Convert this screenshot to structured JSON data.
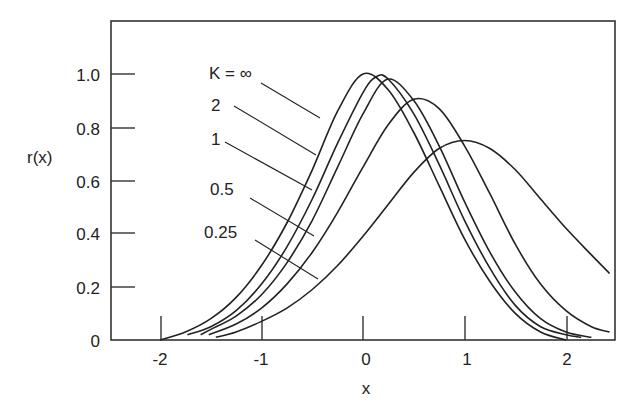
{
  "chart_data": {
    "type": "line",
    "title": "",
    "xlabel": "x",
    "ylabel": "r(x)",
    "xlim": [
      -2.5,
      2.45
    ],
    "ylim": [
      0,
      1.2
    ],
    "grid": false,
    "legend": "inline labels with leader lines",
    "x_ticks": [
      -2,
      -1,
      0,
      1,
      2
    ],
    "x_tick_labels": [
      "-2",
      "-1",
      "0",
      "1",
      "2"
    ],
    "y_ticks": [
      0,
      0.2,
      0.4,
      0.6,
      0.8,
      1.0
    ],
    "y_tick_labels": [
      "0",
      "0.2",
      "0.4",
      "0.6",
      "0.8",
      "1.0"
    ],
    "series": [
      {
        "name": "K=∞",
        "label": "K = ∞",
        "x": [
          -2.0,
          -1.75,
          -1.5,
          -1.25,
          -1.0,
          -0.75,
          -0.5,
          -0.25,
          0.0,
          0.25,
          0.5,
          0.75,
          1.0,
          1.25,
          1.5,
          1.75,
          2.0
        ],
        "y": [
          0.0,
          0.03,
          0.08,
          0.16,
          0.28,
          0.44,
          0.64,
          0.86,
          1.0,
          0.94,
          0.78,
          0.58,
          0.38,
          0.22,
          0.1,
          0.03,
          0.0
        ]
      },
      {
        "name": "K=2",
        "label": "2",
        "x": [
          -1.73,
          -1.5,
          -1.25,
          -1.0,
          -0.75,
          -0.5,
          -0.25,
          0.0,
          0.13,
          0.25,
          0.5,
          0.75,
          1.0,
          1.25,
          1.5,
          1.75,
          2.0,
          2.15
        ],
        "y": [
          0.02,
          0.05,
          0.11,
          0.21,
          0.35,
          0.53,
          0.74,
          0.93,
          0.99,
          0.98,
          0.85,
          0.66,
          0.45,
          0.27,
          0.13,
          0.05,
          0.02,
          0.01
        ]
      },
      {
        "name": "K=1",
        "label": "1",
        "x": [
          -1.6,
          -1.5,
          -1.25,
          -1.0,
          -0.75,
          -0.5,
          -0.25,
          0.0,
          0.24,
          0.5,
          0.75,
          1.0,
          1.25,
          1.5,
          1.75,
          2.0,
          2.25
        ],
        "y": [
          0.02,
          0.04,
          0.09,
          0.17,
          0.29,
          0.45,
          0.65,
          0.85,
          0.98,
          0.9,
          0.73,
          0.52,
          0.33,
          0.18,
          0.08,
          0.03,
          0.01
        ]
      },
      {
        "name": "K=0.5",
        "label": "0.5",
        "x": [
          -1.52,
          -1.25,
          -1.0,
          -0.75,
          -0.5,
          -0.25,
          0.0,
          0.25,
          0.5,
          0.75,
          1.0,
          1.25,
          1.5,
          1.75,
          2.0,
          2.25,
          2.43
        ],
        "y": [
          0.02,
          0.06,
          0.12,
          0.21,
          0.33,
          0.48,
          0.65,
          0.81,
          0.905,
          0.87,
          0.73,
          0.55,
          0.36,
          0.21,
          0.11,
          0.05,
          0.03
        ]
      },
      {
        "name": "K=0.25",
        "label": "0.25",
        "x": [
          -1.45,
          -1.25,
          -1.0,
          -0.75,
          -0.5,
          -0.25,
          0.0,
          0.25,
          0.5,
          0.75,
          1.0,
          1.25,
          1.5,
          1.75,
          2.0,
          2.25,
          2.43
        ],
        "y": [
          0.01,
          0.03,
          0.07,
          0.12,
          0.19,
          0.28,
          0.39,
          0.51,
          0.63,
          0.72,
          0.75,
          0.72,
          0.64,
          0.53,
          0.42,
          0.32,
          0.25
        ]
      }
    ],
    "annotations": [
      {
        "text": "K = ∞",
        "label_x": -1.49,
        "label_y": 0.99,
        "leader_to_x": -0.42,
        "leader_to_y": 0.83
      },
      {
        "text": "2",
        "label_x": -1.49,
        "label_y": 0.86,
        "leader_to_x": -0.47,
        "leader_to_y": 0.69
      },
      {
        "text": "1",
        "label_x": -1.47,
        "label_y": 0.73,
        "leader_to_x": -0.52,
        "leader_to_y": 0.56
      },
      {
        "text": "0.5",
        "label_x": -1.49,
        "label_y": 0.55,
        "leader_to_x": -0.5,
        "leader_to_y": 0.39
      },
      {
        "text": "0.25",
        "label_x": -1.55,
        "label_y": 0.39,
        "leader_to_x": -0.45,
        "leader_to_y": 0.23
      }
    ]
  },
  "axes": {
    "x_title": "x",
    "y_title": "r(x)"
  },
  "labels": {
    "k_inf": "K = ∞",
    "k_2": "2",
    "k_1": "1",
    "k_05": "0.5",
    "k_025": "0.25"
  },
  "ticks": {
    "x": [
      "-2",
      "-1",
      "0",
      "1",
      "2"
    ],
    "y": [
      "0",
      "0.2",
      "0.4",
      "0.6",
      "0.8",
      "1.0"
    ]
  }
}
